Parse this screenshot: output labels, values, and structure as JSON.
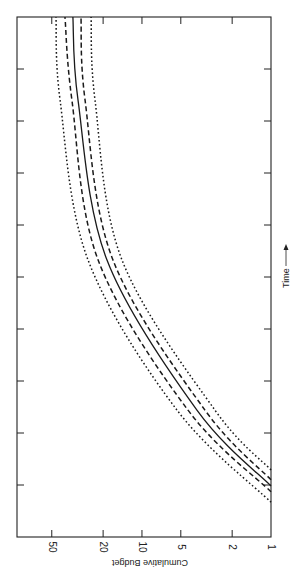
{
  "chart_data": {
    "type": "line",
    "title": "",
    "orientation": "rotated-90",
    "xlabel": "Time",
    "ylabel": "Cumulative Budget",
    "yscale": "log",
    "ylim": [
      1,
      93
    ],
    "xlim": [
      0,
      10
    ],
    "ytick_labels": [
      "1",
      "2",
      "5",
      "10",
      "20",
      "50"
    ],
    "yticks": [
      1,
      2,
      5,
      10,
      20,
      50
    ],
    "xticks": [
      1,
      2,
      3,
      4,
      5,
      6,
      7,
      8,
      9
    ],
    "xtick_labels": [],
    "grid": false,
    "legend": "none",
    "series": [
      {
        "name": "upper-outer-bound",
        "style": "dotted",
        "x": [
          0.67,
          2.44,
          5.33,
          8.4,
          10
        ],
        "y": [
          1,
          5.35,
          26.2,
          43.1,
          46.4
        ]
      },
      {
        "name": "upper-inner-bound",
        "style": "dashed",
        "x": [
          0.87,
          2.44,
          5.33,
          8.4,
          10
        ],
        "y": [
          1,
          4.4,
          21.9,
          34.9,
          39.5
        ]
      },
      {
        "name": "estimate",
        "style": "solid",
        "x": [
          0.98,
          2.44,
          5.33,
          8.4,
          10
        ],
        "y": [
          1,
          3.75,
          18.7,
          31.3,
          34.3
        ]
      },
      {
        "name": "lower-inner-bound",
        "style": "dashed",
        "x": [
          1.1,
          2.44,
          5.33,
          8.4,
          10
        ],
        "y": [
          1,
          3.25,
          16.8,
          27.6,
          29.7
        ]
      },
      {
        "name": "lower-outer-bound",
        "style": "dotted",
        "x": [
          1.29,
          2.44,
          5.33,
          8.4,
          10
        ],
        "y": [
          1,
          2.72,
          14.3,
          23.1,
          24.8
        ]
      }
    ]
  }
}
